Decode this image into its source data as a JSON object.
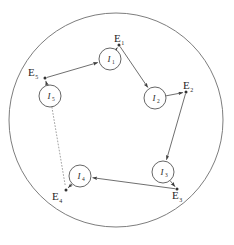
{
  "figure": {
    "title": "",
    "colors": {
      "background": "#ffffff",
      "stroke": "#555555",
      "node_stroke": "#4a4a4a",
      "text": "#1f1f1f",
      "dotted": "#8a8a8a"
    },
    "boundary": {
      "name": "enclosing-circle",
      "cx": 116,
      "cy": 120,
      "r": 107
    },
    "nodes": [
      {
        "id": "I1",
        "label": "I",
        "sub": "1",
        "cx": 110,
        "cy": 59,
        "r": 11
      },
      {
        "id": "I2",
        "label": "I",
        "sub": "2",
        "cx": 155,
        "cy": 98,
        "r": 11
      },
      {
        "id": "I3",
        "label": "I",
        "sub": "3",
        "cx": 163,
        "cy": 172,
        "r": 11
      },
      {
        "id": "I4",
        "label": "I",
        "sub": "4",
        "cx": 80,
        "cy": 176,
        "r": 11
      },
      {
        "id": "I5",
        "label": "I",
        "sub": "5",
        "cx": 50,
        "cy": 96,
        "r": 11
      }
    ],
    "events": [
      {
        "id": "E1",
        "label": "E",
        "sub": "1",
        "px": 119,
        "py": 45,
        "tx": 114,
        "ty": 42
      },
      {
        "id": "E2",
        "label": "E",
        "sub": "2",
        "px": 186,
        "py": 92,
        "tx": 183,
        "ty": 89
      },
      {
        "id": "E3",
        "label": "E",
        "sub": "3",
        "px": 177,
        "py": 189,
        "tx": 172,
        "ty": 199
      },
      {
        "id": "E4",
        "label": "E",
        "sub": "4",
        "px": 66,
        "py": 190,
        "tx": 52,
        "ty": 200
      },
      {
        "id": "E5",
        "label": "E",
        "sub": "5",
        "px": 45,
        "py": 78,
        "tx": 28,
        "ty": 76
      }
    ],
    "edges": [
      {
        "from": "I5",
        "to": "E5",
        "style": "solid",
        "arrow": true
      },
      {
        "from": "E5",
        "to": "I1",
        "style": "solid",
        "arrow": true
      },
      {
        "from": "I1",
        "to": "E1",
        "style": "solid",
        "arrow": true
      },
      {
        "from": "E1",
        "to": "I2",
        "style": "solid",
        "arrow": true
      },
      {
        "from": "I2",
        "to": "E2",
        "style": "solid",
        "arrow": true
      },
      {
        "from": "E2",
        "to": "I3",
        "style": "solid",
        "arrow": true
      },
      {
        "from": "I3",
        "to": "E3",
        "style": "solid",
        "arrow": true
      },
      {
        "from": "E3",
        "to": "I4",
        "style": "solid",
        "arrow": true
      },
      {
        "from": "I4",
        "to": "E4",
        "style": "solid",
        "arrow": true
      },
      {
        "from": "I5",
        "to": "E4",
        "style": "dotted",
        "arrow": false
      }
    ]
  }
}
